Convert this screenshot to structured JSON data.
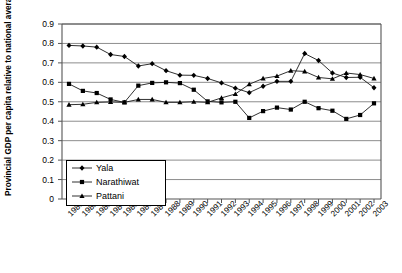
{
  "chart_data": {
    "type": "line",
    "title": "",
    "xlabel": "",
    "ylabel": "Provincial GDP per capita relative to national average",
    "ylim": [
      0,
      0.9
    ],
    "yticks": [
      "0",
      "0.1",
      "0.2",
      "0.3",
      "0.4",
      "0.5",
      "0.6",
      "0.7",
      "0.8",
      "0.9"
    ],
    "ytick_values": [
      0,
      0.1,
      0.2,
      0.3,
      0.4,
      0.5,
      0.6,
      0.7,
      0.8,
      0.9
    ],
    "grid": "horizontal",
    "legend_position": "inside-lower-left",
    "categories": [
      "1981",
      "1982",
      "1983",
      "1984",
      "1985",
      "1986",
      "1987",
      "1988",
      "1989",
      "1990",
      "1991",
      "1992",
      "1993",
      "1994",
      "1995",
      "1996",
      "1997",
      "1998",
      "1999",
      "2000",
      "2001",
      "2002",
      "2003"
    ],
    "series": [
      {
        "name": "Yala",
        "marker": "diamond",
        "values": [
          0.79,
          0.787,
          0.781,
          0.743,
          0.733,
          0.684,
          0.696,
          0.66,
          0.637,
          0.636,
          0.62,
          0.597,
          0.57,
          0.547,
          0.58,
          0.605,
          0.605,
          0.748,
          0.712,
          0.648,
          0.625,
          0.626,
          0.572
        ]
      },
      {
        "name": "Narathiwat",
        "marker": "square",
        "values": [
          0.592,
          0.556,
          0.545,
          0.512,
          0.497,
          0.583,
          0.597,
          0.6,
          0.596,
          0.562,
          0.502,
          0.497,
          0.5,
          0.417,
          0.452,
          0.47,
          0.46,
          0.5,
          0.467,
          0.454,
          0.412,
          0.432,
          0.492
        ]
      },
      {
        "name": "Pattani",
        "marker": "triangle",
        "values": [
          0.485,
          0.487,
          0.497,
          0.499,
          0.497,
          0.512,
          0.512,
          0.497,
          0.497,
          0.5,
          0.497,
          0.52,
          0.54,
          0.59,
          0.62,
          0.632,
          0.66,
          0.656,
          0.625,
          0.618,
          0.648,
          0.64,
          0.62
        ]
      }
    ]
  },
  "legend": {
    "items": [
      {
        "label": "Yala"
      },
      {
        "label": "Narathiwat"
      },
      {
        "label": "Pattani"
      }
    ]
  }
}
